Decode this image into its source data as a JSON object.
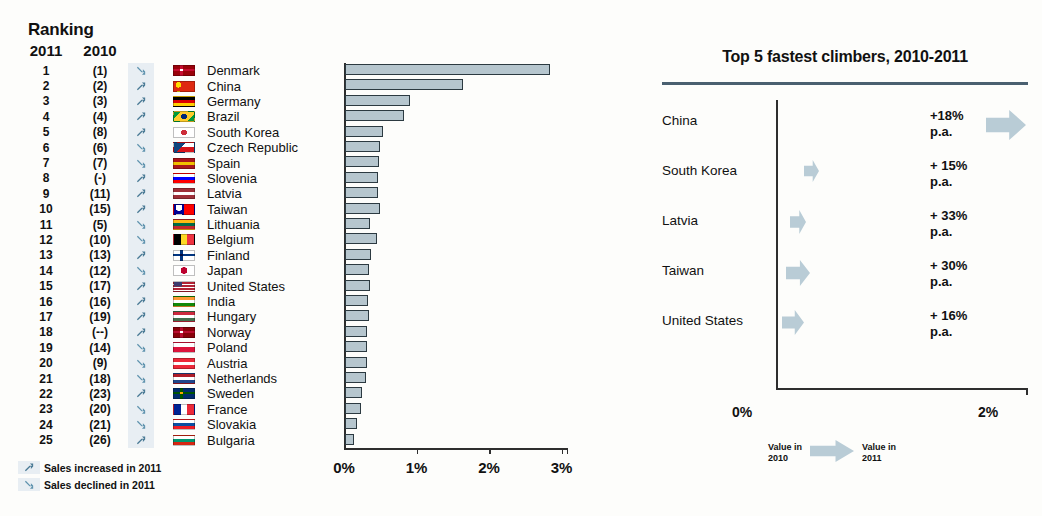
{
  "left": {
    "title": "Ranking",
    "columns": {
      "year_2011": "2011",
      "year_2010": "2010"
    },
    "rows": [
      {
        "r2011": "1",
        "r2010": "(1)",
        "trend": "down",
        "country": "Denmark",
        "flag": [
          "#c60c30",
          "#ffffff"
        ],
        "flag_type": "nordic",
        "value": 2.83
      },
      {
        "r2011": "2",
        "r2010": "(2)",
        "trend": "up",
        "country": "China",
        "flag": [
          "#de2910",
          "#ffde00"
        ],
        "flag_type": "china",
        "value": 1.63
      },
      {
        "r2011": "3",
        "r2010": "(3)",
        "trend": "up",
        "country": "Germany",
        "flag": [
          "#000000",
          "#dd0000",
          "#ffce00"
        ],
        "flag_type": "hstripe3",
        "value": 0.9
      },
      {
        "r2011": "4",
        "r2010": "(4)",
        "trend": "up",
        "country": "Brazil",
        "flag": [
          "#009b3a",
          "#ffcc29",
          "#002776"
        ],
        "flag_type": "brazil",
        "value": 0.82
      },
      {
        "r2011": "5",
        "r2010": "(8)",
        "trend": "up",
        "country": "South Korea",
        "flag": [
          "#ffffff",
          "#cd2e3a",
          "#0047a0"
        ],
        "flag_type": "korea",
        "value": 0.52
      },
      {
        "r2011": "6",
        "r2010": "(6)",
        "trend": "down",
        "country": "Czech Republic",
        "flag": [
          "#ffffff",
          "#d7141a",
          "#11457e"
        ],
        "flag_type": "czech",
        "value": 0.48
      },
      {
        "r2011": "7",
        "r2010": "(7)",
        "trend": "down",
        "country": "Spain",
        "flag": [
          "#aa151b",
          "#f1bf00",
          "#aa151b"
        ],
        "flag_type": "hstripe3",
        "value": 0.47
      },
      {
        "r2011": "8",
        "r2010": "(-)",
        "trend": "up",
        "country": "Slovenia",
        "flag": [
          "#ffffff",
          "#0000ff",
          "#ff0000"
        ],
        "flag_type": "hstripe3",
        "value": 0.45
      },
      {
        "r2011": "9",
        "r2010": "(11)",
        "trend": "up",
        "country": "Latvia",
        "flag": [
          "#9e3039",
          "#ffffff",
          "#9e3039"
        ],
        "flag_type": "hstripe3",
        "value": 0.45
      },
      {
        "r2011": "10",
        "r2010": "(15)",
        "trend": "up",
        "country": "Taiwan",
        "flag": [
          "#fe0000",
          "#000095"
        ],
        "flag_type": "taiwan",
        "value": 0.48
      },
      {
        "r2011": "11",
        "r2010": "(5)",
        "trend": "down",
        "country": "Lithuania",
        "flag": [
          "#fdb913",
          "#006a44",
          "#c1272d"
        ],
        "flag_type": "hstripe3",
        "value": 0.35
      },
      {
        "r2011": "12",
        "r2010": "(10)",
        "trend": "down",
        "country": "Belgium",
        "flag": [
          "#000000",
          "#fdda24",
          "#ef3340"
        ],
        "flag_type": "vstripe3",
        "value": 0.44
      },
      {
        "r2011": "13",
        "r2010": "(13)",
        "trend": "up",
        "country": "Finland",
        "flag": [
          "#ffffff",
          "#003580"
        ],
        "flag_type": "nordic",
        "value": 0.36
      },
      {
        "r2011": "14",
        "r2010": "(12)",
        "trend": "down",
        "country": "Japan",
        "flag": [
          "#ffffff",
          "#bc002d"
        ],
        "flag_type": "japan",
        "value": 0.33
      },
      {
        "r2011": "15",
        "r2010": "(17)",
        "trend": "up",
        "country": "United States",
        "flag": [
          "#b22234",
          "#ffffff",
          "#3c3b6e"
        ],
        "flag_type": "usa",
        "value": 0.34
      },
      {
        "r2011": "16",
        "r2010": "(16)",
        "trend": "up",
        "country": "India",
        "flag": [
          "#ff9933",
          "#ffffff",
          "#138808"
        ],
        "flag_type": "hstripe3",
        "value": 0.32
      },
      {
        "r2011": "17",
        "r2010": "(19)",
        "trend": "up",
        "country": "Hungary",
        "flag": [
          "#cd2a3e",
          "#ffffff",
          "#436f4d"
        ],
        "flag_type": "hstripe3",
        "value": 0.33
      },
      {
        "r2011": "18",
        "r2010": "(--)",
        "trend": "up",
        "country": "Norway",
        "flag": [
          "#ba0c2f",
          "#ffffff"
        ],
        "flag_type": "nordic",
        "value": 0.31
      },
      {
        "r2011": "19",
        "r2010": "(14)",
        "trend": "down",
        "country": "Poland",
        "flag": [
          "#ffffff",
          "#dc143c"
        ],
        "flag_type": "hstripe2",
        "value": 0.31
      },
      {
        "r2011": "20",
        "r2010": "(9)",
        "trend": "down",
        "country": "Austria",
        "flag": [
          "#ed2939",
          "#ffffff",
          "#ed2939"
        ],
        "flag_type": "hstripe3",
        "value": 0.3
      },
      {
        "r2011": "21",
        "r2010": "(18)",
        "trend": "down",
        "country": "Netherlands",
        "flag": [
          "#ae1c28",
          "#ffffff",
          "#21468b"
        ],
        "flag_type": "hstripe3",
        "value": 0.29
      },
      {
        "r2011": "22",
        "r2010": "(23)",
        "trend": "up",
        "country": "Sweden",
        "flag": [
          "#006aa7",
          "#fecc00"
        ],
        "flag_type": "nordic",
        "value": 0.23
      },
      {
        "r2011": "23",
        "r2010": "(20)",
        "trend": "down",
        "country": "France",
        "flag": [
          "#002395",
          "#ffffff",
          "#ed2939"
        ],
        "flag_type": "vstripe3",
        "value": 0.22
      },
      {
        "r2011": "24",
        "r2010": "(21)",
        "trend": "down",
        "country": "Slovakia",
        "flag": [
          "#ffffff",
          "#0b4ea2",
          "#ee1c25"
        ],
        "flag_type": "hstripe3",
        "value": 0.17
      },
      {
        "r2011": "25",
        "r2010": "(26)",
        "trend": "up",
        "country": "Bulgaria",
        "flag": [
          "#ffffff",
          "#00966e",
          "#d62612"
        ],
        "flag_type": "hstripe3",
        "value": 0.13
      }
    ],
    "legend": [
      {
        "trend": "up",
        "label": "Sales increased in 2011"
      },
      {
        "trend": "down",
        "label": "Sales declined in 2011"
      }
    ]
  },
  "chart_data": [
    {
      "type": "bar",
      "title": "",
      "xlabel": "",
      "ylabel": "",
      "orientation": "horizontal",
      "xlim": [
        0,
        3.1
      ],
      "xticks": [
        0,
        1,
        2,
        3
      ],
      "xtick_labels": [
        "0%",
        "1%",
        "2%",
        "3%"
      ],
      "grid": false,
      "categories": [
        "Denmark",
        "China",
        "Germany",
        "Brazil",
        "South Korea",
        "Czech Republic",
        "Spain",
        "Slovenia",
        "Latvia",
        "Taiwan",
        "Lithuania",
        "Belgium",
        "Finland",
        "Japan",
        "United States",
        "India",
        "Hungary",
        "Norway",
        "Poland",
        "Austria",
        "Netherlands",
        "Sweden",
        "France",
        "Slovakia",
        "Bulgaria"
      ],
      "values": [
        2.83,
        1.63,
        0.9,
        0.82,
        0.52,
        0.48,
        0.47,
        0.45,
        0.45,
        0.48,
        0.35,
        0.44,
        0.36,
        0.33,
        0.34,
        0.32,
        0.33,
        0.31,
        0.31,
        0.3,
        0.29,
        0.23,
        0.22,
        0.17,
        0.13
      ]
    },
    {
      "type": "bar",
      "title": "Top 5 fastest climbers, 2010-2011",
      "orientation": "horizontal",
      "xlim": [
        0,
        2.05
      ],
      "xticks": [
        0,
        2
      ],
      "xtick_labels": [
        "0%",
        "2%"
      ],
      "grid": false,
      "categories": [
        "China",
        "South Korea",
        "Latvia",
        "Taiwan",
        "United States"
      ],
      "annotations": [
        "+18%\np.a.",
        "+ 15%\np.a.",
        "+ 33%\np.a.",
        "+ 30%\np.a.",
        "+ 16%\np.a."
      ],
      "values_2010": [
        1.38,
        0.14,
        0.1,
        0.12,
        0.09
      ],
      "values_2011": [
        1.63,
        0.16,
        0.13,
        0.16,
        0.11
      ]
    }
  ],
  "right": {
    "title": "Top 5 fastest climbers, 2010-2011",
    "rows": [
      {
        "label": "China",
        "value": "+18%\np.a.",
        "arrow_left": 204,
        "arrow_w": 40,
        "arrow_h": 30
      },
      {
        "label": "South Korea",
        "value": "+ 15%\np.a.",
        "arrow_left": 22,
        "arrow_w": 15,
        "arrow_h": 22
      },
      {
        "label": "Latvia",
        "value": "+ 33%\np.a.",
        "arrow_left": 8,
        "arrow_w": 16,
        "arrow_h": 24
      },
      {
        "label": "Taiwan",
        "value": "+ 30%\np.a.",
        "arrow_left": 4,
        "arrow_w": 24,
        "arrow_h": 26
      },
      {
        "label": "United States",
        "value": "+ 16%\np.a.",
        "arrow_left": 0,
        "arrow_w": 22,
        "arrow_h": 25
      }
    ],
    "axis": {
      "left_label": "0%",
      "right_label": "2%"
    },
    "legend": {
      "left": "Value in\n2010",
      "right": "Value in\n2011"
    }
  },
  "colors": {
    "arrow_up": "#4a7a95",
    "arrow_down": "#5f93ae",
    "arrow_block_bg": "#e8eef3",
    "bar_fill": "#b6c6ce",
    "bar_stroke": "#2c3a41",
    "rule": "#4a6070",
    "climber_arrow": "#b9ccd6"
  }
}
